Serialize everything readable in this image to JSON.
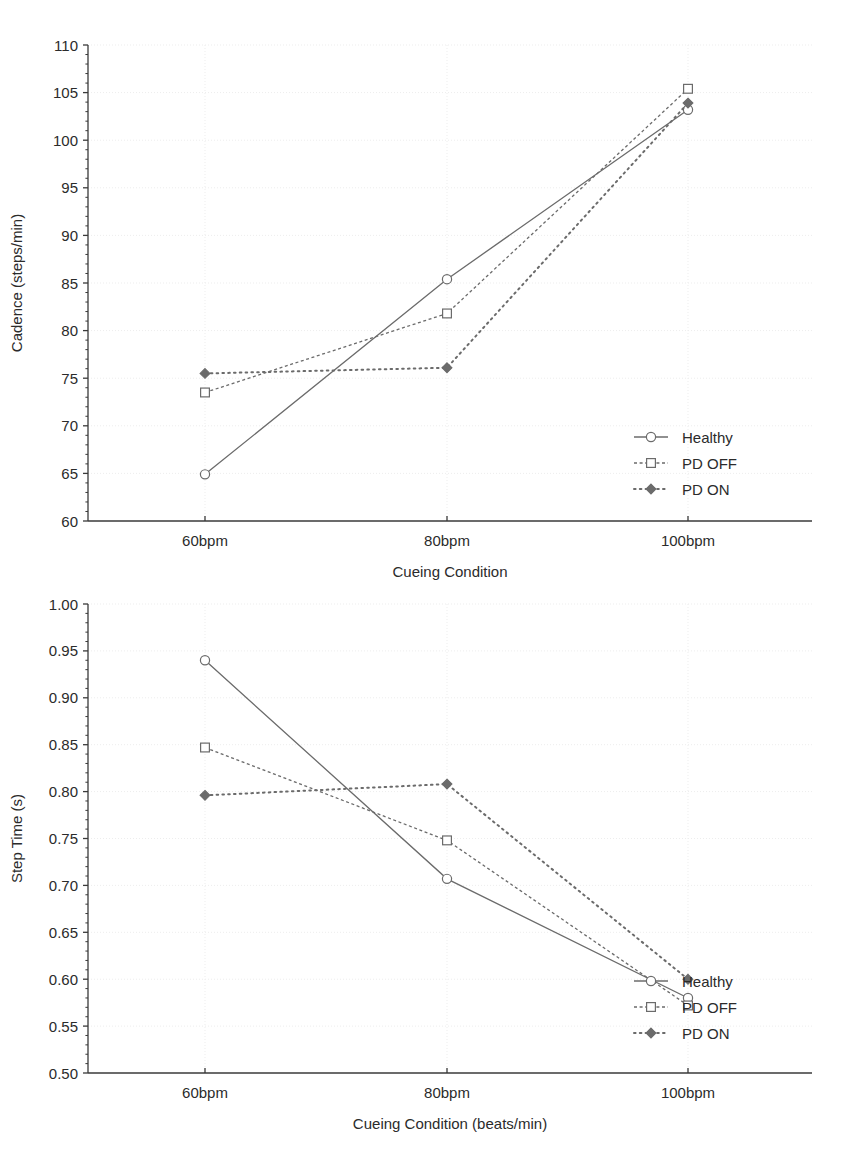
{
  "charts": [
    {
      "id": "cadence",
      "name": "cadence-chart",
      "ylabel": "Cadence (steps/min)",
      "xlabel": "Cueing Condition",
      "xticks": [
        "60bpm",
        "80bpm",
        "100bpm"
      ],
      "yticks": [
        "60",
        "65",
        "70",
        "75",
        "80",
        "85",
        "90",
        "95",
        "100",
        "105",
        "110"
      ],
      "legend": [
        "Healthy",
        "PD OFF",
        "PD ON"
      ]
    },
    {
      "id": "steptime",
      "name": "step-time-chart",
      "ylabel": "Step Time (s)",
      "xlabel": "Cueing Condition (beats/min)",
      "xticks": [
        "60bpm",
        "80bpm",
        "100bpm"
      ],
      "yticks": [
        "0.50",
        "0.55",
        "0.60",
        "0.65",
        "0.70",
        "0.75",
        "0.80",
        "0.85",
        "0.90",
        "0.95",
        "1.00"
      ],
      "legend": [
        "Healthy",
        "PD OFF",
        "PD ON"
      ]
    }
  ],
  "chart_data": [
    {
      "type": "line",
      "title": "",
      "xlabel": "Cueing Condition",
      "ylabel": "Cadence (steps/min)",
      "categories": [
        "60bpm",
        "80bpm",
        "100bpm"
      ],
      "ylim": [
        60,
        110
      ],
      "ytick_step": 5,
      "grid": true,
      "legend_position": "bottom-right",
      "series": [
        {
          "name": "Healthy",
          "values": [
            64.9,
            85.4,
            103.2
          ],
          "line": "solid",
          "marker": "open-circle",
          "color": "#6b6b6b"
        },
        {
          "name": "PD OFF",
          "values": [
            73.5,
            81.8,
            105.4
          ],
          "line": "dashed",
          "marker": "open-square",
          "color": "#6b6b6b"
        },
        {
          "name": "PD ON",
          "values": [
            75.5,
            76.1,
            103.9
          ],
          "line": "dotted",
          "marker": "filled-diamond",
          "color": "#6b6b6b"
        }
      ]
    },
    {
      "type": "line",
      "title": "",
      "xlabel": "Cueing Condition (beats/min)",
      "ylabel": "Step Time (s)",
      "categories": [
        "60bpm",
        "80bpm",
        "100bpm"
      ],
      "ylim": [
        0.5,
        1.0
      ],
      "ytick_step": 0.05,
      "grid": true,
      "legend_position": "bottom-right",
      "series": [
        {
          "name": "Healthy",
          "values": [
            0.94,
            0.707,
            0.58
          ],
          "line": "solid",
          "marker": "open-circle",
          "color": "#6b6b6b"
        },
        {
          "name": "PD OFF",
          "values": [
            0.847,
            0.748,
            0.572
          ],
          "line": "dashed",
          "marker": "open-square",
          "color": "#6b6b6b"
        },
        {
          "name": "PD ON",
          "values": [
            0.796,
            0.808,
            0.6
          ],
          "line": "dotted",
          "marker": "filled-diamond",
          "color": "#6b6b6b"
        }
      ]
    }
  ],
  "colors": {
    "axis": "#3a3a3a",
    "grid": "#ededed",
    "series": "#6b6b6b",
    "text": "#2b2b2b",
    "background": "#ffffff"
  }
}
